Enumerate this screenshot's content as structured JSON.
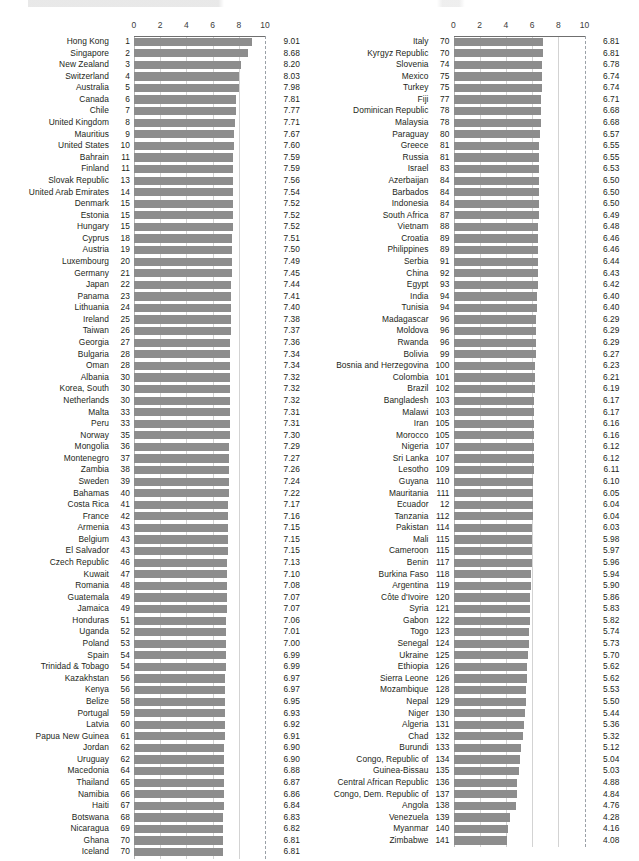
{
  "chart_data": {
    "type": "bar",
    "orientation": "horizontal",
    "title": "",
    "xlabel": "",
    "ylabel": "",
    "xlim": [
      0,
      10
    ],
    "xticks": [
      "0",
      "2",
      "4",
      "6",
      "8",
      "10"
    ],
    "xtick_values": [
      0,
      2,
      4,
      6,
      8,
      10
    ],
    "grid": true,
    "dashed_gridline_at": 10,
    "bar_color": "#8d8d8d",
    "gridline_color": "#d3d3d3",
    "text_color": "#231f20",
    "legend": [],
    "panels": [
      {
        "name": "left-panel",
        "categories": [
          "Hong Kong",
          "Singapore",
          "New Zealand",
          "Switzerland",
          "Australia",
          "Canada",
          "Chile",
          "United Kingdom",
          "Mauritius",
          "United States",
          "Bahrain",
          "Finland",
          "Slovak Republic",
          "United Arab Emirates",
          "Denmark",
          "Estonia",
          "Hungary",
          "Cyprus",
          "Austria",
          "Luxembourg",
          "Germany",
          "Japan",
          "Panama",
          "Lithuania",
          "Ireland",
          "Taiwan",
          "Georgia",
          "Bulgaria",
          "Oman",
          "Albania",
          "Korea, South",
          "Netherlands",
          "Malta",
          "Peru",
          "Norway",
          "Mongolia",
          "Montenegro",
          "Zambia",
          "Sweden",
          "Bahamas",
          "Costa Rica",
          "France",
          "Armenia",
          "Belgium",
          "El Salvador",
          "Czech Republic",
          "Kuwait",
          "Romania",
          "Guatemala",
          "Jamaica",
          "Honduras",
          "Uganda",
          "Poland",
          "Spain",
          "Trinidad & Tobago",
          "Kazakhstan",
          "Kenya",
          "Belize",
          "Portugal",
          "Latvia",
          "Papua New Guinea",
          "Jordan",
          "Uruguay",
          "Macedonia",
          "Thailand",
          "Namibia",
          "Haiti",
          "Botswana",
          "Nicaragua",
          "Ghana",
          "Iceland"
        ],
        "ranks": [
          "1",
          "2",
          "3",
          "4",
          "5",
          "6",
          "7",
          "8",
          "9",
          "10",
          "11",
          "11",
          "13",
          "14",
          "15",
          "15",
          "15",
          "18",
          "19",
          "20",
          "21",
          "22",
          "23",
          "24",
          "25",
          "26",
          "27",
          "28",
          "28",
          "30",
          "30",
          "30",
          "33",
          "33",
          "35",
          "36",
          "37",
          "38",
          "39",
          "40",
          "41",
          "42",
          "43",
          "43",
          "43",
          "46",
          "47",
          "48",
          "49",
          "49",
          "51",
          "52",
          "53",
          "54",
          "54",
          "56",
          "56",
          "58",
          "59",
          "60",
          "61",
          "62",
          "62",
          "64",
          "65",
          "66",
          "67",
          "68",
          "69",
          "70",
          "70"
        ],
        "values": [
          9.01,
          8.68,
          8.2,
          8.03,
          7.98,
          7.81,
          7.77,
          7.71,
          7.67,
          7.6,
          7.59,
          7.59,
          7.56,
          7.54,
          7.52,
          7.52,
          7.52,
          7.51,
          7.5,
          7.49,
          7.45,
          7.44,
          7.41,
          7.4,
          7.38,
          7.37,
          7.36,
          7.34,
          7.34,
          7.32,
          7.32,
          7.32,
          7.31,
          7.31,
          7.3,
          7.29,
          7.27,
          7.26,
          7.24,
          7.22,
          7.17,
          7.16,
          7.15,
          7.15,
          7.15,
          7.13,
          7.1,
          7.08,
          7.07,
          7.07,
          7.06,
          7.01,
          7.0,
          6.99,
          6.99,
          6.97,
          6.97,
          6.95,
          6.93,
          6.92,
          6.91,
          6.9,
          6.9,
          6.88,
          6.87,
          6.86,
          6.84,
          6.83,
          6.82,
          6.81,
          6.81
        ],
        "value_labels": [
          "9.01",
          "8.68",
          "8.20",
          "8.03",
          "7.98",
          "7.81",
          "7.77",
          "7.71",
          "7.67",
          "7.60",
          "7.59",
          "7.59",
          "7.56",
          "7.54",
          "7.52",
          "7.52",
          "7.52",
          "7.51",
          "7.50",
          "7.49",
          "7.45",
          "7.44",
          "7.41",
          "7.40",
          "7.38",
          "7.37",
          "7.36",
          "7.34",
          "7.34",
          "7.32",
          "7.32",
          "7.32",
          "7.31",
          "7.31",
          "7.30",
          "7.29",
          "7.27",
          "7.26",
          "7.24",
          "7.22",
          "7.17",
          "7.16",
          "7.15",
          "7.15",
          "7.15",
          "7.13",
          "7.10",
          "7.08",
          "7.07",
          "7.07",
          "7.06",
          "7.01",
          "7.00",
          "6.99",
          "6.99",
          "6.97",
          "6.97",
          "6.95",
          "6.93",
          "6.92",
          "6.91",
          "6.90",
          "6.90",
          "6.88",
          "6.87",
          "6.86",
          "6.84",
          "6.83",
          "6.82",
          "6.81",
          "6.81"
        ]
      },
      {
        "name": "right-panel",
        "categories": [
          "Italy",
          "Kyrgyz Republic",
          "Slovenia",
          "Mexico",
          "Turkey",
          "Fiji",
          "Dominican Republic",
          "Malaysia",
          "Paraguay",
          "Greece",
          "Russia",
          "Israel",
          "Azerbaijan",
          "Barbados",
          "Indonesia",
          "South Africa",
          "Vietnam",
          "Croatia",
          "Philippines",
          "Serbia",
          "China",
          "Egypt",
          "India",
          "Tunisia",
          "Madagascar",
          "Moldova",
          "Rwanda",
          "Bolivia",
          "Bosnia and Herzegovina",
          "Colombia",
          "Brazil",
          "Bangladesh",
          "Malawi",
          "Iran",
          "Morocco",
          "Nigeria",
          "Sri Lanka",
          "Lesotho",
          "Guyana",
          "Mauritania",
          "Ecuador",
          "Tanzania",
          "Pakistan",
          "Mali",
          "Cameroon",
          "Benin",
          "Burkina Faso",
          "Argentina",
          "Côte d'Ivoire",
          "Syria",
          "Gabon",
          "Togo",
          "Senegal",
          "Ukraine",
          "Ethiopia",
          "Sierra Leone",
          "Mozambique",
          "Nepal",
          "Niger",
          "Algeria",
          "Chad",
          "Burundi",
          "Congo, Republic of",
          "Guinea-Bissau",
          "Central African Republic",
          "Congo, Dem. Republic of",
          "Angola",
          "Venezuela",
          "Myanmar",
          "Zimbabwe"
        ],
        "ranks": [
          "70",
          "70",
          "74",
          "75",
          "75",
          "77",
          "78",
          "78",
          "80",
          "81",
          "81",
          "83",
          "84",
          "84",
          "84",
          "87",
          "88",
          "89",
          "89",
          "91",
          "92",
          "93",
          "94",
          "94",
          "96",
          "96",
          "96",
          "99",
          "100",
          "101",
          "102",
          "103",
          "103",
          "105",
          "105",
          "107",
          "107",
          "109",
          "110",
          "111",
          "12",
          "112",
          "114",
          "115",
          "115",
          "117",
          "118",
          "119",
          "120",
          "121",
          "122",
          "123",
          "124",
          "125",
          "126",
          "126",
          "128",
          "129",
          "130",
          "131",
          "132",
          "133",
          "134",
          "135",
          "136",
          "137",
          "138",
          "139",
          "140",
          "141"
        ],
        "values": [
          6.81,
          6.81,
          6.78,
          6.74,
          6.74,
          6.71,
          6.68,
          6.68,
          6.57,
          6.55,
          6.55,
          6.53,
          6.5,
          6.5,
          6.5,
          6.49,
          6.48,
          6.46,
          6.46,
          6.44,
          6.43,
          6.42,
          6.4,
          6.4,
          6.29,
          6.29,
          6.29,
          6.27,
          6.23,
          6.21,
          6.19,
          6.17,
          6.17,
          6.16,
          6.16,
          6.12,
          6.12,
          6.11,
          6.1,
          6.05,
          6.04,
          6.04,
          6.03,
          5.98,
          5.97,
          5.96,
          5.94,
          5.9,
          5.86,
          5.83,
          5.82,
          5.74,
          5.73,
          5.7,
          5.62,
          5.62,
          5.53,
          5.5,
          5.44,
          5.36,
          5.32,
          5.12,
          5.04,
          5.03,
          4.88,
          4.84,
          4.76,
          4.28,
          4.16,
          4.08
        ],
        "value_labels": [
          "6.81",
          "6.81",
          "6.78",
          "6.74",
          "6.74",
          "6.71",
          "6.68",
          "6.68",
          "6.57",
          "6.55",
          "6.55",
          "6.53",
          "6.50",
          "6.50",
          "6.50",
          "6.49",
          "6.48",
          "6.46",
          "6.46",
          "6.44",
          "6.43",
          "6.42",
          "6.40",
          "6.40",
          "6.29",
          "6.29",
          "6.29",
          "6.27",
          "6.23",
          "6.21",
          "6.19",
          "6.17",
          "6.17",
          "6.16",
          "6.16",
          "6.12",
          "6.12",
          "6.11",
          "6.10",
          "6.05",
          "6.04",
          "6.04",
          "6.03",
          "5.98",
          "5.97",
          "5.96",
          "5.94",
          "5.90",
          "5.86",
          "5.83",
          "5.82",
          "5.74",
          "5.73",
          "5.70",
          "5.62",
          "5.62",
          "5.53",
          "5.50",
          "5.44",
          "5.36",
          "5.32",
          "5.12",
          "5.04",
          "5.03",
          "4.88",
          "4.84",
          "4.76",
          "4.28",
          "4.16",
          "4.08"
        ]
      }
    ]
  }
}
